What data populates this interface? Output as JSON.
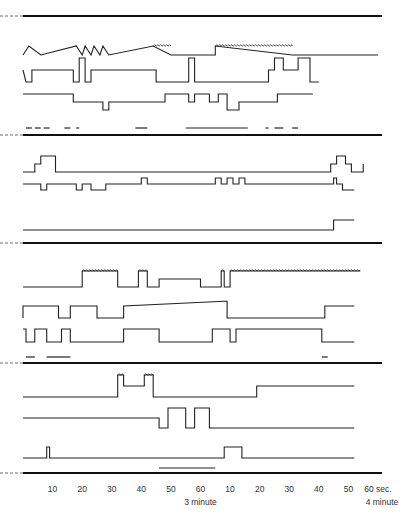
{
  "chart_data": {
    "type": "line",
    "title": "",
    "xlabel": "",
    "ylabel": "",
    "x_range_seconds": [
      0,
      120
    ],
    "xticks": [
      {
        "label": "10",
        "sub": ""
      },
      {
        "label": "20",
        "sub": ""
      },
      {
        "label": "30",
        "sub": ""
      },
      {
        "label": "40",
        "sub": ""
      },
      {
        "label": "50",
        "sub": ""
      },
      {
        "label": "60",
        "sub": "3 minute"
      },
      {
        "label": "10",
        "sub": ""
      },
      {
        "label": "20",
        "sub": ""
      },
      {
        "label": "30",
        "sub": ""
      },
      {
        "label": "40",
        "sub": ""
      },
      {
        "label": "50",
        "sub": ""
      },
      {
        "label": "60 sec.",
        "sub": "4 minute"
      }
    ],
    "panels": [
      {
        "name": "panel-1",
        "traces": [
          {
            "base": 0,
            "steps": [
              [
                0,
                0
              ],
              [
                2,
                1
              ],
              [
                6,
                0
              ],
              [
                18,
                1
              ],
              [
                20,
                0
              ],
              [
                21,
                1
              ],
              [
                23,
                0
              ],
              [
                24,
                1
              ],
              [
                26,
                0
              ],
              [
                27,
                1
              ],
              [
                29,
                0
              ],
              [
                44,
                1
              ],
              [
                50,
                0
              ],
              [
                65,
                0
              ],
              [
                65,
                1
              ],
              [
                91,
                0
              ],
              [
                120,
                0
              ]
            ],
            "noisy": [
              [
                44,
                50
              ],
              [
                65,
                91
              ]
            ]
          },
          {
            "base": 0,
            "steps": [
              [
                0,
                1
              ],
              [
                1,
                0
              ],
              [
                3,
                0
              ],
              [
                3,
                1
              ],
              [
                17,
                1
              ],
              [
                17,
                0
              ],
              [
                19,
                0
              ],
              [
                19,
                2
              ],
              [
                21,
                2
              ],
              [
                21,
                0
              ],
              [
                23,
                0
              ],
              [
                23,
                1
              ],
              [
                45,
                1
              ],
              [
                45,
                0
              ],
              [
                56,
                0
              ],
              [
                56,
                2
              ],
              [
                58,
                2
              ],
              [
                58,
                0
              ],
              [
                83,
                0
              ],
              [
                83,
                1
              ],
              [
                85,
                1
              ],
              [
                85,
                2
              ],
              [
                88,
                2
              ],
              [
                88,
                1
              ],
              [
                93,
                1
              ],
              [
                93,
                2
              ],
              [
                97,
                2
              ],
              [
                97,
                0
              ],
              [
                100,
                0
              ]
            ]
          },
          {
            "base": 0,
            "steps": [
              [
                0,
                1
              ],
              [
                17,
                1
              ],
              [
                17,
                0
              ],
              [
                27,
                0
              ],
              [
                27,
                -1
              ],
              [
                29,
                -1
              ],
              [
                29,
                0
              ],
              [
                48,
                0
              ],
              [
                48,
                1
              ],
              [
                56,
                1
              ],
              [
                56,
                0
              ],
              [
                58,
                0
              ],
              [
                58,
                1
              ],
              [
                63,
                1
              ],
              [
                63,
                0
              ],
              [
                66,
                0
              ],
              [
                66,
                1
              ],
              [
                69,
                1
              ],
              [
                69,
                -1
              ],
              [
                73,
                -1
              ],
              [
                73,
                0
              ],
              [
                86,
                0
              ],
              [
                86,
                1
              ],
              [
                98,
                1
              ]
            ]
          }
        ],
        "bars": [
          [
            1,
            3
          ],
          [
            4,
            6
          ],
          [
            7,
            9
          ],
          [
            14,
            16
          ],
          [
            18,
            19
          ],
          [
            38,
            42
          ],
          [
            55,
            76
          ],
          [
            82,
            83
          ],
          [
            85,
            88
          ],
          [
            91,
            93
          ]
        ]
      },
      {
        "name": "panel-2",
        "traces": [
          {
            "base": 0,
            "steps": [
              [
                0,
                0
              ],
              [
                4,
                0
              ],
              [
                4,
                1
              ],
              [
                6,
                1
              ],
              [
                6,
                2
              ],
              [
                11,
                2
              ],
              [
                11,
                0
              ],
              [
                104,
                0
              ],
              [
                104,
                1
              ],
              [
                106,
                1
              ],
              [
                106,
                2
              ],
              [
                109,
                2
              ],
              [
                109,
                1
              ],
              [
                111,
                1
              ],
              [
                111,
                0
              ],
              [
                115,
                0
              ],
              [
                115,
                1
              ]
            ]
          },
          {
            "base": 0,
            "steps": [
              [
                0,
                1
              ],
              [
                6,
                1
              ],
              [
                6,
                0
              ],
              [
                8,
                0
              ],
              [
                8,
                1
              ],
              [
                18,
                1
              ],
              [
                18,
                0
              ],
              [
                20,
                0
              ],
              [
                20,
                1
              ],
              [
                23,
                1
              ],
              [
                23,
                0
              ],
              [
                28,
                0
              ],
              [
                28,
                1
              ],
              [
                40,
                1
              ],
              [
                40,
                2
              ],
              [
                42,
                2
              ],
              [
                42,
                1
              ],
              [
                65,
                1
              ],
              [
                65,
                2
              ],
              [
                67,
                2
              ],
              [
                67,
                1
              ],
              [
                69,
                1
              ],
              [
                69,
                2
              ],
              [
                71,
                2
              ],
              [
                71,
                1
              ],
              [
                73,
                1
              ],
              [
                73,
                2
              ],
              [
                75,
                2
              ],
              [
                75,
                1
              ],
              [
                105,
                1
              ],
              [
                105,
                2
              ],
              [
                106,
                2
              ],
              [
                106,
                1
              ],
              [
                108,
                1
              ],
              [
                108,
                0
              ],
              [
                112,
                0
              ]
            ]
          },
          {
            "base": 0,
            "steps": [
              [
                0,
                0
              ],
              [
                105,
                0
              ],
              [
                105,
                1
              ],
              [
                112,
                1
              ]
            ]
          }
        ],
        "bars": []
      },
      {
        "name": "panel-3",
        "traces": [
          {
            "base": 0,
            "steps": [
              [
                0,
                0
              ],
              [
                20,
                0
              ],
              [
                20,
                1
              ],
              [
                32,
                1
              ],
              [
                32,
                0
              ],
              [
                39,
                0
              ],
              [
                39,
                1
              ],
              [
                42,
                1
              ],
              [
                42,
                0
              ],
              [
                46,
                0
              ],
              [
                46,
                0.5
              ],
              [
                60,
                0.5
              ],
              [
                60,
                0
              ],
              [
                67,
                0
              ],
              [
                67,
                1
              ],
              [
                68,
                1
              ],
              [
                68,
                0
              ],
              [
                70,
                0
              ],
              [
                70,
                1
              ],
              [
                114,
                1
              ]
            ],
            "noisy": [
              [
                20,
                32
              ],
              [
                39,
                42
              ],
              [
                67,
                68
              ],
              [
                70,
                114
              ]
            ]
          },
          {
            "base": 0,
            "steps": [
              [
                0,
                0
              ],
              [
                0,
                1
              ],
              [
                12,
                1
              ],
              [
                12,
                0
              ],
              [
                16,
                0
              ],
              [
                16,
                1
              ],
              [
                25,
                1
              ],
              [
                25,
                0
              ],
              [
                34,
                0
              ],
              [
                34,
                1
              ],
              [
                68,
                1.4
              ],
              [
                69,
                1.4
              ],
              [
                69,
                0
              ],
              [
                102,
                0
              ],
              [
                102,
                1
              ],
              [
                112,
                1
              ]
            ]
          },
          {
            "base": 0,
            "steps": [
              [
                0,
                1
              ],
              [
                1,
                1
              ],
              [
                1,
                0
              ],
              [
                4,
                0
              ],
              [
                4,
                1
              ],
              [
                8,
                1
              ],
              [
                8,
                0
              ],
              [
                13,
                0
              ],
              [
                13,
                1
              ],
              [
                16,
                1
              ],
              [
                16,
                0
              ],
              [
                34,
                0
              ],
              [
                34,
                1
              ],
              [
                46,
                1
              ],
              [
                46,
                0
              ],
              [
                64,
                0
              ],
              [
                64,
                1
              ],
              [
                70,
                1
              ],
              [
                70,
                0
              ],
              [
                72,
                0
              ],
              [
                72,
                1
              ],
              [
                101,
                1
              ],
              [
                101,
                0
              ],
              [
                112,
                0
              ]
            ]
          }
        ],
        "bars": [
          [
            1,
            4
          ],
          [
            8,
            16
          ],
          [
            101,
            103
          ]
        ]
      },
      {
        "name": "panel-4",
        "traces": [
          {
            "base": 0,
            "steps": [
              [
                0,
                0
              ],
              [
                32,
                0
              ],
              [
                32,
                2
              ],
              [
                34,
                2
              ],
              [
                34,
                1
              ],
              [
                41,
                1
              ],
              [
                41,
                2
              ],
              [
                44,
                2
              ],
              [
                44,
                0
              ],
              [
                79,
                0
              ],
              [
                79,
                1
              ],
              [
                112,
                1
              ]
            ],
            "noisy": [
              [
                32,
                34
              ],
              [
                41,
                44
              ]
            ]
          },
          {
            "base": 0,
            "steps": [
              [
                0,
                1
              ],
              [
                46,
                1
              ],
              [
                46,
                0
              ],
              [
                49,
                0
              ],
              [
                49,
                2
              ],
              [
                55,
                2
              ],
              [
                55,
                0
              ],
              [
                58,
                0
              ],
              [
                58,
                2
              ],
              [
                63,
                2
              ],
              [
                63,
                0
              ],
              [
                112,
                0
              ]
            ]
          },
          {
            "base": 0,
            "steps": [
              [
                0,
                0
              ],
              [
                8,
                0
              ],
              [
                8,
                1
              ],
              [
                9,
                1
              ],
              [
                9,
                0
              ],
              [
                68,
                0
              ],
              [
                68,
                1
              ],
              [
                74,
                1
              ],
              [
                74,
                0
              ],
              [
                112,
                0
              ]
            ]
          }
        ],
        "bars": [
          [
            46,
            65
          ]
        ]
      }
    ],
    "grid": false,
    "legend": "none"
  }
}
